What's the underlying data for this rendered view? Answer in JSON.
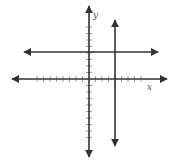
{
  "chart_data": {
    "type": "coordinate-plane",
    "title": "",
    "xlabel": "x",
    "ylabel": "y",
    "origin_px": [
      89,
      79
    ],
    "unit_px": 6.5,
    "x_ticks": [
      -8,
      -7,
      -6,
      -5,
      -4,
      -3,
      -2,
      -1,
      1,
      2,
      3,
      4,
      5,
      6,
      7,
      8
    ],
    "y_ticks": [
      -9,
      -8,
      -7,
      -6,
      -5,
      -4,
      -3,
      -2,
      -1,
      1,
      2,
      3,
      4,
      5,
      6,
      7,
      8
    ],
    "grid": false,
    "lines": [
      {
        "name": "horizontal-line",
        "equation": "y = 4",
        "arrows": "both"
      },
      {
        "name": "vertical-line",
        "equation": "x = 4",
        "arrows": "both"
      }
    ]
  },
  "labels": {
    "x_axis": "x",
    "y_axis": "y"
  },
  "colors": {
    "line": "#333333",
    "tick": "#888888",
    "background": "#ffffff"
  }
}
